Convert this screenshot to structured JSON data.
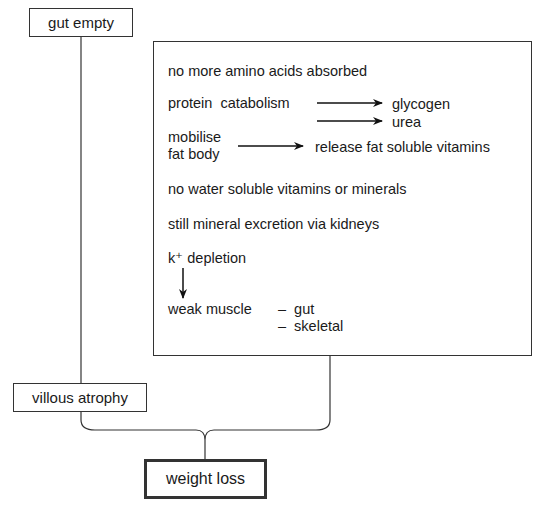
{
  "nodes": {
    "gut_empty": "gut empty",
    "villous_atrophy": "villous atrophy",
    "weight_loss": "weight loss"
  },
  "main_box": {
    "amino": "no more amino acids absorbed",
    "protein": "protein  catabolism",
    "glycogen": "glycogen",
    "urea": "urea",
    "mobilise": "mobilise",
    "fat_body": "fat body",
    "release": "release fat soluble vitamins",
    "water": "no water soluble vitamins or minerals",
    "excretion": "still mineral excretion via kidneys",
    "k_depletion": "k⁺ depletion",
    "weak_muscle": "weak muscle",
    "gut": "–  gut",
    "skeletal": "–  skeletal"
  }
}
